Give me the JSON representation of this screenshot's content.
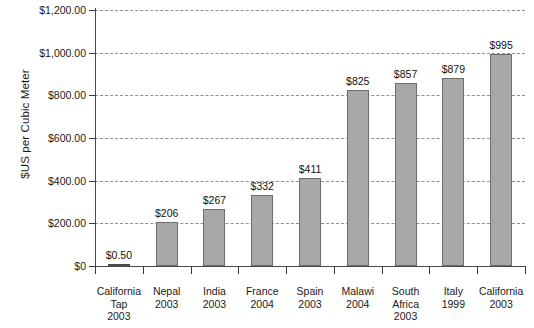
{
  "chart_data": {
    "type": "bar",
    "title": "",
    "subtitle": "",
    "xlabel": "",
    "ylabel": "$US per Cubic Meter",
    "ylim": [
      0,
      1200
    ],
    "grid": true,
    "legend": "none",
    "orientation": "vertical",
    "categories": [
      "California Tap 2003",
      "Nepal 2003",
      "India 2003",
      "France 2004",
      "Spain 2003",
      "Malawi 2004",
      "South Africa 2003",
      "Italy 1999",
      "California 2003"
    ],
    "category_lines": [
      [
        "California",
        "Tap",
        "2003"
      ],
      [
        "Nepal",
        "2003"
      ],
      [
        "India",
        "2003"
      ],
      [
        "France",
        "2004"
      ],
      [
        "Spain",
        "2003"
      ],
      [
        "Malawi",
        "2004"
      ],
      [
        "South",
        "Africa",
        "2003"
      ],
      [
        "Italy",
        "1999"
      ],
      [
        "California",
        "2003"
      ]
    ],
    "values": [
      0.5,
      206,
      267,
      332,
      411,
      825,
      857,
      879,
      995
    ],
    "value_labels": [
      "$0.50",
      "$206",
      "$267",
      "$332",
      "$411",
      "$825",
      "$857",
      "$879",
      "$995"
    ],
    "ytick_values": [
      0,
      200,
      400,
      600,
      800,
      1000,
      1200
    ],
    "ytick_labels": [
      "$0",
      "$200.00",
      "$400.00",
      "$600.00",
      "$800.00",
      "$1,000.00",
      "$1,200.00"
    ],
    "colors": {
      "bar_fill": "#a8a8a8",
      "bar_stroke": "#6d6d6d",
      "gridline": "#8f8f8f",
      "axis": "#4a4a4a",
      "text": "#1a1a1a",
      "background": "#ffffff"
    }
  }
}
